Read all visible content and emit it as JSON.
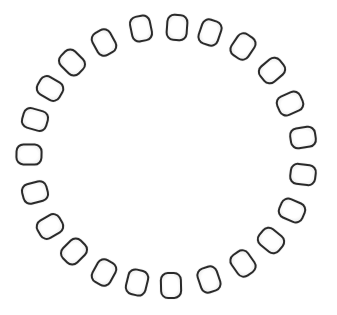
{
  "figure": {
    "center": [
      168,
      157
    ],
    "bead_count": 23,
    "bead_color": "#2a2a2a",
    "background": "#ffffff",
    "beads": [
      {
        "x": 141,
        "y": 28
      },
      {
        "x": 177,
        "y": 27
      },
      {
        "x": 210,
        "y": 32
      },
      {
        "x": 243,
        "y": 46
      },
      {
        "x": 272,
        "y": 70
      },
      {
        "x": 290,
        "y": 103
      },
      {
        "x": 303,
        "y": 137
      },
      {
        "x": 303,
        "y": 174
      },
      {
        "x": 292,
        "y": 210
      },
      {
        "x": 271,
        "y": 240
      },
      {
        "x": 243,
        "y": 263
      },
      {
        "x": 209,
        "y": 279
      },
      {
        "x": 171,
        "y": 285
      },
      {
        "x": 137,
        "y": 282
      },
      {
        "x": 104,
        "y": 272
      },
      {
        "x": 74,
        "y": 251
      },
      {
        "x": 50,
        "y": 226
      },
      {
        "x": 35,
        "y": 192
      },
      {
        "x": 29,
        "y": 154
      },
      {
        "x": 35,
        "y": 119
      },
      {
        "x": 50,
        "y": 88
      },
      {
        "x": 72,
        "y": 62
      },
      {
        "x": 104,
        "y": 42
      }
    ]
  }
}
